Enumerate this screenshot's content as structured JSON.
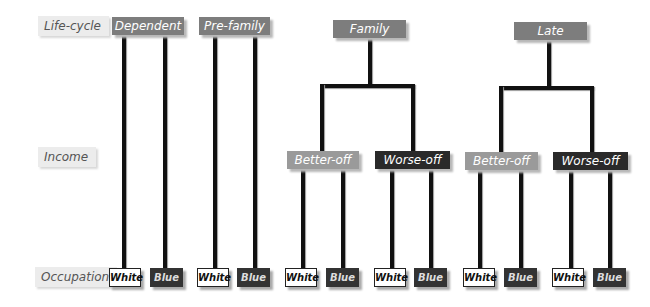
{
  "row_labels": {
    "lifecycle": "Life-cycle",
    "income": "Income",
    "occupation": "Occupation"
  },
  "lifecycle_nodes": [
    "Dependent",
    "Pre-family",
    "Family",
    "Late"
  ],
  "income_nodes": {
    "family_better": "Better-off",
    "family_worse": "Worse-off",
    "late_better": "Better-off",
    "late_worse": "Worse-off"
  },
  "occupation_leaves": [
    "White",
    "Blue",
    "White",
    "Blue",
    "White",
    "Blue",
    "White",
    "Blue",
    "White",
    "Blue",
    "White",
    "Blue"
  ],
  "colors": {
    "lifecycle_node": "#7d7d7d",
    "better_off": "#9a9a9a",
    "worse_off": "#2a2a2a",
    "blue_leaf": "#333333",
    "white_leaf": "#ffffff",
    "connector": "#111111"
  }
}
